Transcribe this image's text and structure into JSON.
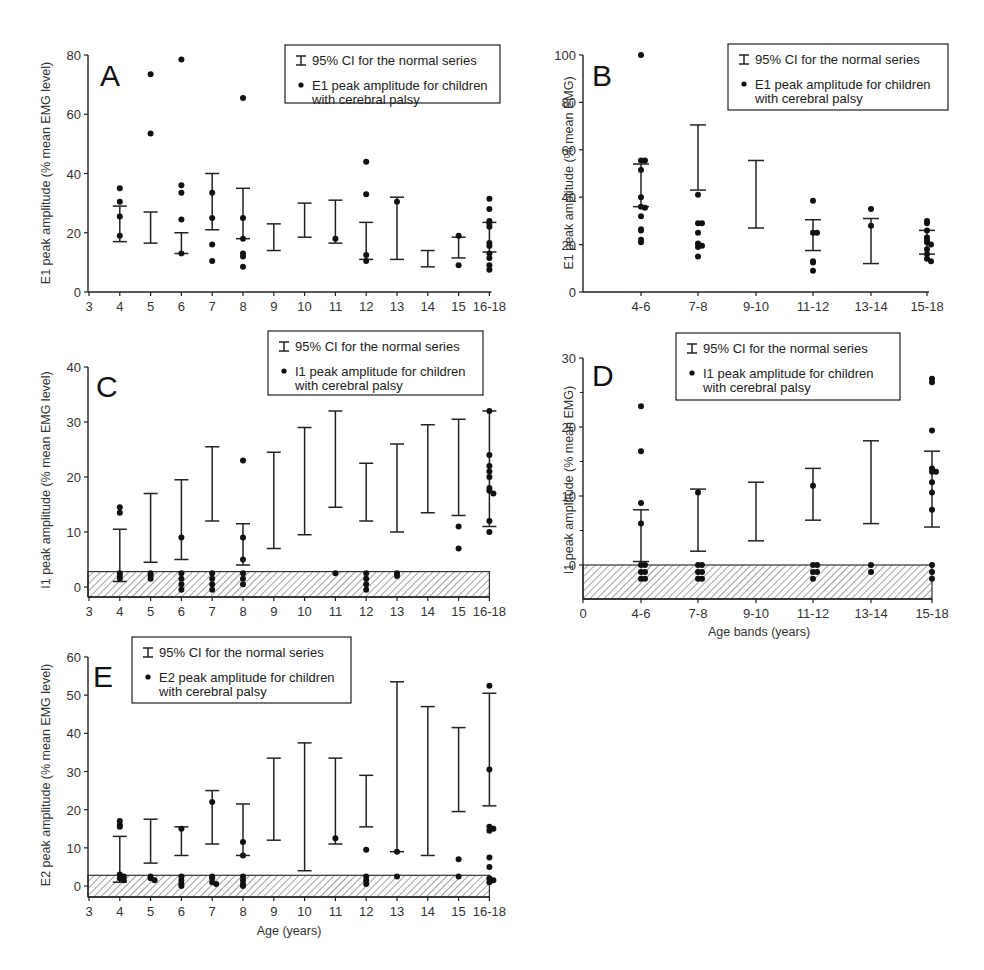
{
  "figure": {
    "legend_ci": "95% CI for the normal series",
    "legend_points_suffix": "peak amplitude for children",
    "legend_points_line2": "with cerebral palsy"
  },
  "chart_data": [
    {
      "id": "A",
      "type": "scatter",
      "title": "A",
      "xlabel": "",
      "ylabel": "E1 peak amplitude (% mean EMG level)",
      "legend": [
        "95% CI for the normal series",
        "E1 peak amplitude for children with cerebral palsy"
      ],
      "categories": [
        "3",
        "4",
        "5",
        "6",
        "7",
        "8",
        "9",
        "10",
        "11",
        "12",
        "13",
        "14",
        "15",
        "16-18"
      ],
      "ylim": [
        0,
        80
      ],
      "yticks": [
        0,
        20,
        40,
        60,
        80
      ],
      "ci": [
        {
          "x": "4",
          "low": 17,
          "high": 29
        },
        {
          "x": "5",
          "low": 16.5,
          "high": 27
        },
        {
          "x": "6",
          "low": 13,
          "high": 20
        },
        {
          "x": "7",
          "low": 21,
          "high": 40
        },
        {
          "x": "8",
          "low": 18,
          "high": 35
        },
        {
          "x": "9",
          "low": 14,
          "high": 23
        },
        {
          "x": "10",
          "low": 18.5,
          "high": 30
        },
        {
          "x": "11",
          "low": 16.5,
          "high": 31
        },
        {
          "x": "12",
          "low": 11,
          "high": 23.5
        },
        {
          "x": "13",
          "low": 11,
          "high": 32
        },
        {
          "x": "14",
          "low": 8.5,
          "high": 14
        },
        {
          "x": "15",
          "low": 11.5,
          "high": 18.5
        },
        {
          "x": "16-18",
          "low": 13.5,
          "high": 23.5
        }
      ],
      "points": [
        {
          "x": "4",
          "values": [
            35,
            30.5,
            25.5,
            19
          ]
        },
        {
          "x": "5",
          "values": [
            73.5,
            53.5
          ]
        },
        {
          "x": "6",
          "values": [
            78.5,
            36,
            33.5,
            24.5,
            13
          ]
        },
        {
          "x": "7",
          "values": [
            33.5,
            25,
            16,
            10.5
          ]
        },
        {
          "x": "8",
          "values": [
            65.5,
            25,
            18,
            13,
            12,
            8.5
          ]
        },
        {
          "x": "11",
          "values": [
            18
          ]
        },
        {
          "x": "12",
          "values": [
            44,
            33,
            12.5,
            10.5
          ]
        },
        {
          "x": "13",
          "values": [
            30.5
          ]
        },
        {
          "x": "15",
          "values": [
            19,
            9
          ]
        },
        {
          "x": "16-18",
          "values": [
            31.5,
            28,
            24,
            23,
            22,
            16.5,
            15.5,
            13,
            11.5,
            9,
            7.5
          ]
        }
      ],
      "grid": false,
      "legend_position": "top-right"
    },
    {
      "id": "B",
      "type": "scatter",
      "title": "B",
      "xlabel": "",
      "ylabel": "E1 peak amplitude (% mean EMG)",
      "legend": [
        "95% CI for the normal series",
        "E1 peak amplitude for children with cerebral palsy"
      ],
      "categories": [
        "4-6",
        "7-8",
        "9-10",
        "11-12",
        "13-14",
        "15-18"
      ],
      "ylim": [
        0,
        100
      ],
      "yticks": [
        0,
        20,
        40,
        60,
        80,
        100
      ],
      "ci": [
        {
          "x": "4-6",
          "low": 36,
          "high": 54
        },
        {
          "x": "7-8",
          "low": 43,
          "high": 70.5
        },
        {
          "x": "9-10",
          "low": 27,
          "high": 55.5
        },
        {
          "x": "11-12",
          "low": 17.5,
          "high": 30.5
        },
        {
          "x": "13-14",
          "low": 12,
          "high": 31
        },
        {
          "x": "15-18",
          "low": 16,
          "high": 26
        }
      ],
      "points": [
        {
          "x": "4-6",
          "values": [
            100,
            55.5,
            55.5,
            51.5,
            40,
            36,
            35.5,
            32,
            26.5,
            26,
            22,
            21
          ]
        },
        {
          "x": "7-8",
          "values": [
            41,
            29,
            29,
            25,
            20.5,
            19.5,
            19,
            15
          ]
        },
        {
          "x": "11-12",
          "values": [
            38.5,
            25,
            25,
            13,
            12.5,
            9
          ]
        },
        {
          "x": "13-14",
          "values": [
            35,
            28
          ]
        },
        {
          "x": "15-18",
          "values": [
            30,
            29,
            26,
            23,
            22,
            21,
            20,
            18,
            16,
            14,
            13
          ]
        }
      ],
      "grid": false,
      "legend_position": "top-right"
    },
    {
      "id": "C",
      "type": "scatter",
      "title": "C",
      "xlabel": "",
      "ylabel": "I1 peak amplitude (% mean EMG level)",
      "legend": [
        "95% CI for the normal series",
        "I1 peak amplitude for children with cerebral palsy"
      ],
      "categories": [
        "3",
        "4",
        "5",
        "6",
        "7",
        "8",
        "9",
        "10",
        "11",
        "12",
        "13",
        "14",
        "15",
        "16-18"
      ],
      "ylim": [
        -2,
        40
      ],
      "yticks": [
        0,
        10,
        20,
        30,
        40
      ],
      "shaded_band": {
        "low": -2,
        "high": 2.8,
        "pattern": "hatched"
      },
      "ci": [
        {
          "x": "4",
          "low": 1,
          "high": 10.5
        },
        {
          "x": "5",
          "low": 4.5,
          "high": 17
        },
        {
          "x": "6",
          "low": 5,
          "high": 19.5
        },
        {
          "x": "7",
          "low": 12,
          "high": 25.5
        },
        {
          "x": "8",
          "low": 4,
          "high": 11.5
        },
        {
          "x": "9",
          "low": 7,
          "high": 24.5
        },
        {
          "x": "10",
          "low": 9.5,
          "high": 29
        },
        {
          "x": "11",
          "low": 14.5,
          "high": 32
        },
        {
          "x": "12",
          "low": 12,
          "high": 22.5
        },
        {
          "x": "13",
          "low": 10,
          "high": 26
        },
        {
          "x": "14",
          "low": 13.5,
          "high": 29.5
        },
        {
          "x": "15",
          "low": 13,
          "high": 30.5
        },
        {
          "x": "16-18",
          "low": 11,
          "high": 32
        }
      ],
      "points": [
        {
          "x": "4",
          "values": [
            14.5,
            13.5,
            2.5,
            2,
            1.5
          ]
        },
        {
          "x": "5",
          "values": [
            2.5,
            2,
            1.5
          ]
        },
        {
          "x": "6",
          "values": [
            9,
            2.5,
            1.5,
            0.5,
            -0.5
          ]
        },
        {
          "x": "7",
          "values": [
            2.5,
            1.5,
            0.5,
            -0.5
          ]
        },
        {
          "x": "8",
          "values": [
            23,
            9,
            5,
            2.5,
            1.5,
            0.5
          ]
        },
        {
          "x": "11",
          "values": [
            2.5
          ]
        },
        {
          "x": "12",
          "values": [
            2.5,
            1.5,
            0.5,
            -0.5
          ]
        },
        {
          "x": "13",
          "values": [
            2.5,
            2
          ]
        },
        {
          "x": "15",
          "values": [
            11,
            7
          ]
        },
        {
          "x": "16-18",
          "values": [
            32,
            24,
            22,
            21,
            20,
            18,
            17.5,
            17,
            12,
            10
          ]
        }
      ],
      "grid": false,
      "legend_position": "top-right"
    },
    {
      "id": "D",
      "type": "scatter",
      "title": "D",
      "xlabel": "Age bands (years)",
      "ylabel": "I1 peak amplitude (% mean EMG)",
      "legend": [
        "95% CI for the normal series",
        "I1 peak amplitude for children with cerebral palsy"
      ],
      "categories": [
        "0",
        "4-6",
        "7-8",
        "9-10",
        "11-12",
        "13-14",
        "15-18"
      ],
      "ylim": [
        -5,
        30
      ],
      "yticks": [
        0,
        10,
        20,
        30
      ],
      "shaded_band": {
        "low": -5,
        "high": 0,
        "pattern": "hatched"
      },
      "ci": [
        {
          "x": "4-6",
          "low": 0.5,
          "high": 8
        },
        {
          "x": "7-8",
          "low": 2,
          "high": 11
        },
        {
          "x": "9-10",
          "low": 3.5,
          "high": 12
        },
        {
          "x": "11-12",
          "low": 6.5,
          "high": 14
        },
        {
          "x": "13-14",
          "low": 6,
          "high": 18
        },
        {
          "x": "15-18",
          "low": 5.5,
          "high": 16.5
        }
      ],
      "points": [
        {
          "x": "4-6",
          "values": [
            23,
            16.5,
            9,
            6,
            0,
            0,
            -1,
            -1,
            -2,
            -2
          ]
        },
        {
          "x": "7-8",
          "values": [
            10.5,
            0,
            0,
            -1,
            -1,
            -2,
            -2
          ]
        },
        {
          "x": "11-12",
          "values": [
            11.5,
            0,
            0,
            -1,
            -1,
            -2
          ]
        },
        {
          "x": "13-14",
          "values": [
            0,
            -1
          ]
        },
        {
          "x": "15-18",
          "values": [
            27,
            26.5,
            19.5,
            14,
            13.5,
            13.5,
            12,
            10.5,
            8,
            0,
            -1,
            -2
          ]
        }
      ],
      "grid": false,
      "legend_position": "top-right"
    },
    {
      "id": "E",
      "type": "scatter",
      "title": "E",
      "xlabel": "Age (years)",
      "ylabel": "E2 peak amplitude (% mean EMG level)",
      "legend": [
        "95% CI for the normal series",
        "E2 peak amplitude for children with cerebral palsy"
      ],
      "categories": [
        "3",
        "4",
        "5",
        "6",
        "7",
        "8",
        "9",
        "10",
        "11",
        "12",
        "13",
        "14",
        "15",
        "16-18"
      ],
      "ylim": [
        -3,
        60
      ],
      "yticks": [
        0,
        10,
        20,
        30,
        40,
        50,
        60
      ],
      "shaded_band": {
        "low": -3,
        "high": 2.8,
        "pattern": "hatched"
      },
      "ci": [
        {
          "x": "4",
          "low": 1,
          "high": 13
        },
        {
          "x": "5",
          "low": 6,
          "high": 17.5
        },
        {
          "x": "6",
          "low": 8,
          "high": 15.5
        },
        {
          "x": "7",
          "low": 11,
          "high": 25
        },
        {
          "x": "8",
          "low": 8,
          "high": 21.5
        },
        {
          "x": "9",
          "low": 12,
          "high": 33.5
        },
        {
          "x": "10",
          "low": 4,
          "high": 37.5
        },
        {
          "x": "11",
          "low": 11,
          "high": 33.5
        },
        {
          "x": "12",
          "low": 15.5,
          "high": 29
        },
        {
          "x": "13",
          "low": 9,
          "high": 53.5
        },
        {
          "x": "14",
          "low": 8,
          "high": 47
        },
        {
          "x": "15",
          "low": 19.5,
          "high": 41.5
        },
        {
          "x": "16-18",
          "low": 21,
          "high": 50.5
        }
      ],
      "points": [
        {
          "x": "4",
          "values": [
            17,
            16,
            15.5,
            3,
            2.5,
            2,
            1.5
          ]
        },
        {
          "x": "5",
          "values": [
            2.5,
            2,
            1.5
          ]
        },
        {
          "x": "6",
          "values": [
            15,
            2.5,
            1.5,
            0.5,
            0
          ]
        },
        {
          "x": "7",
          "values": [
            22,
            2.5,
            2,
            1,
            0.5
          ]
        },
        {
          "x": "8",
          "values": [
            11.5,
            8,
            2.5,
            1.5,
            0.5,
            0
          ]
        },
        {
          "x": "11",
          "values": [
            12.5
          ]
        },
        {
          "x": "12",
          "values": [
            9.5,
            2.5,
            1.5,
            0.5
          ]
        },
        {
          "x": "13",
          "values": [
            9,
            2.5
          ]
        },
        {
          "x": "15",
          "values": [
            7,
            2.5
          ]
        },
        {
          "x": "16-18",
          "values": [
            52.5,
            30.5,
            15.5,
            15,
            14.5,
            7.5,
            5,
            2,
            1.5,
            1
          ]
        }
      ],
      "grid": false,
      "legend_position": "top-left"
    }
  ]
}
